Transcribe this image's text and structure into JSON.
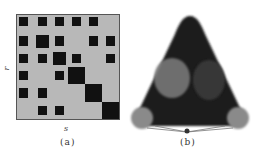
{
  "figure": {
    "panel_a": {
      "caption": "(a)",
      "x_label": "s",
      "y_label": "r",
      "grid_size": 6,
      "colors": {
        "background": "#b8b8b8",
        "block": "#111111",
        "border": "#555555"
      },
      "blocks": [
        {
          "row": 1,
          "col": 1,
          "size": "small"
        },
        {
          "row": 1,
          "col": 2,
          "size": "small"
        },
        {
          "row": 1,
          "col": 3,
          "size": "small"
        },
        {
          "row": 1,
          "col": 4,
          "size": "small"
        },
        {
          "row": 1,
          "col": 5,
          "size": "small"
        },
        {
          "row": 2,
          "col": 1,
          "size": "small"
        },
        {
          "row": 2,
          "col": 2,
          "size": "medium"
        },
        {
          "row": 2,
          "col": 3,
          "size": "small"
        },
        {
          "row": 2,
          "col": 5,
          "size": "small"
        },
        {
          "row": 2,
          "col": 6,
          "size": "small"
        },
        {
          "row": 3,
          "col": 1,
          "size": "small"
        },
        {
          "row": 3,
          "col": 2,
          "size": "small"
        },
        {
          "row": 3,
          "col": 3,
          "size": "medium"
        },
        {
          "row": 3,
          "col": 4,
          "size": "small"
        },
        {
          "row": 3,
          "col": 6,
          "size": "small"
        },
        {
          "row": 4,
          "col": 1,
          "size": "small"
        },
        {
          "row": 4,
          "col": 3,
          "size": "small"
        },
        {
          "row": 4,
          "col": 4,
          "size": "large"
        },
        {
          "row": 5,
          "col": 1,
          "size": "small"
        },
        {
          "row": 5,
          "col": 2,
          "size": "small"
        },
        {
          "row": 5,
          "col": 5,
          "size": "large"
        },
        {
          "row": 6,
          "col": 2,
          "size": "small"
        },
        {
          "row": 6,
          "col": 3,
          "size": "small"
        },
        {
          "row": 6,
          "col": 6,
          "size": "large"
        }
      ]
    },
    "panel_b": {
      "caption": "(b)",
      "shape": "triangular network layout",
      "colors": {
        "dense": "#1a1a1a",
        "cluster": "#7a7a7a",
        "cluster_light": "#8c8c8c"
      },
      "clusters": [
        "upper-left cluster",
        "upper-right cluster",
        "bottom-left node",
        "bottom-right node"
      ]
    }
  }
}
